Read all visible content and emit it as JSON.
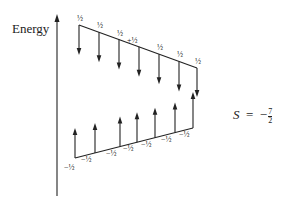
{
  "axis": {
    "label": "Energy"
  },
  "formula": {
    "symbol": "S",
    "equals": "=",
    "value": "−",
    "frac_num": "7",
    "frac_den": "2"
  },
  "colors": {
    "line": "#222222",
    "background": "#ffffff"
  },
  "upper_level": {
    "description": "spin-down states, decreasing energy left to right",
    "arrow_direction": "down",
    "labels": [
      "½",
      "½",
      "½",
      "+½",
      "½",
      "½",
      "½"
    ]
  },
  "lower_level": {
    "description": "spin-up states, increasing energy left to right",
    "arrow_direction": "up",
    "labels": [
      "−½",
      "−½",
      "−½",
      "−½",
      "−½",
      "−½",
      "−½"
    ]
  }
}
